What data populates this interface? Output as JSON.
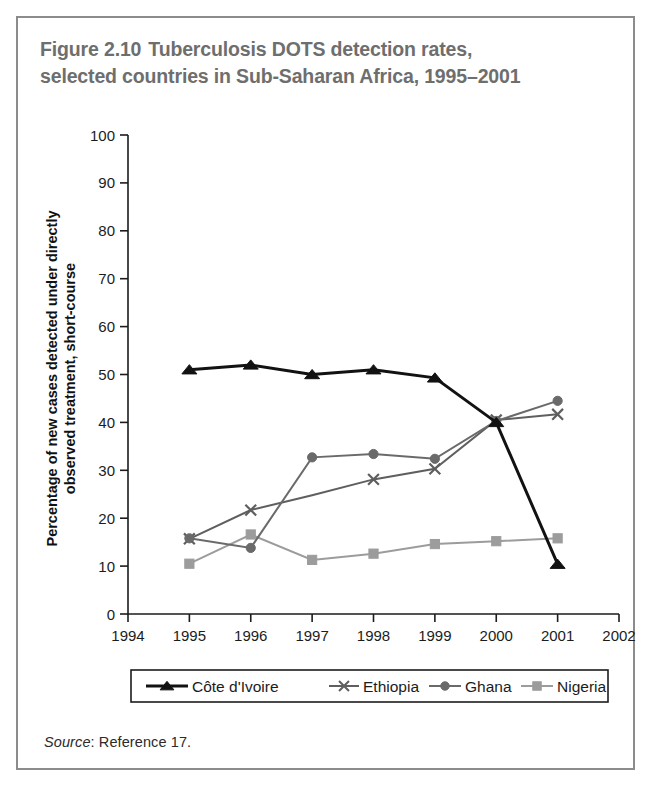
{
  "figure": {
    "number": "Figure 2.10",
    "title_line1": "Tuberculosis DOTS detection rates,",
    "title_line2": "selected countries in Sub-Saharan Africa, 1995–2001",
    "source_label": "Source",
    "source_text": ": Reference 17."
  },
  "chart_data": {
    "type": "line",
    "xlabel": "",
    "ylabel": "Percentage of new cases detected under directly observed treatment, short-course",
    "ylabel_line1": "Percentage of new cases detected under directly",
    "ylabel_line2": "observed treatment, short-course",
    "x": [
      1995,
      1996,
      1997,
      1998,
      1999,
      2000,
      2001
    ],
    "xlim": [
      1994,
      2002
    ],
    "ylim": [
      0,
      100
    ],
    "xticks": [
      1994,
      1995,
      1996,
      1997,
      1998,
      1999,
      2000,
      2001,
      2002
    ],
    "xticklabels": [
      "1994",
      "1995",
      "1996",
      "1997",
      "1998",
      "1999",
      "2000",
      "2001",
      "2002"
    ],
    "yticks": [
      0,
      10,
      20,
      30,
      40,
      50,
      60,
      70,
      80,
      90,
      100
    ],
    "yticklabels": [
      "0",
      "10",
      "20",
      "30",
      "40",
      "50",
      "60",
      "70",
      "80",
      "90",
      "100"
    ],
    "grid": false,
    "legend_position": "below-axes",
    "series": [
      {
        "name": "Côte d'Ivoire",
        "color": "#121212",
        "marker": "triangle",
        "linewidth": 3.0,
        "values": [
          51.0,
          52.0,
          50.0,
          51.0,
          49.3,
          40.0,
          10.4
        ]
      },
      {
        "name": "Ethiopia",
        "color": "#5f5f5f",
        "marker": "x",
        "linewidth": 2.0,
        "values": [
          15.7,
          21.7,
          24.8,
          28.1,
          30.3,
          40.5,
          41.7
        ],
        "marker_visible": [
          true,
          true,
          false,
          true,
          true,
          true,
          true
        ]
      },
      {
        "name": "Ghana",
        "color": "#6a6a6a",
        "marker": "circle",
        "linewidth": 2.0,
        "values": [
          15.8,
          13.8,
          32.7,
          33.4,
          32.4,
          40.3,
          44.5
        ]
      },
      {
        "name": "Nigeria",
        "color": "#9c9c9c",
        "marker": "square",
        "linewidth": 2.0,
        "values": [
          10.5,
          16.6,
          11.3,
          12.6,
          14.6,
          15.2,
          15.8
        ]
      }
    ]
  },
  "legend": {
    "items": [
      {
        "label": "Côte d'Ivoire",
        "color": "#121212",
        "marker": "triangle"
      },
      {
        "label": "Ethiopia",
        "color": "#5f5f5f",
        "marker": "x"
      },
      {
        "label": "Ghana",
        "color": "#6a6a6a",
        "marker": "circle"
      },
      {
        "label": "Nigeria",
        "color": "#9c9c9c",
        "marker": "square"
      }
    ]
  }
}
